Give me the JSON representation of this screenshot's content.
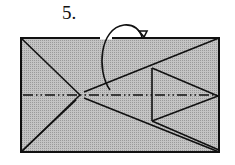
{
  "step": {
    "number": "5."
  },
  "diagram": {
    "type": "origami-fold-diagram",
    "paper_color": "#b8b8b8",
    "line_color": "#111111",
    "elements": [
      "rectangle-paper",
      "diagonal-crease-lines",
      "horizontal-mountain-fold-line",
      "inner-triangle-flap",
      "fold-behind-arrow"
    ]
  }
}
